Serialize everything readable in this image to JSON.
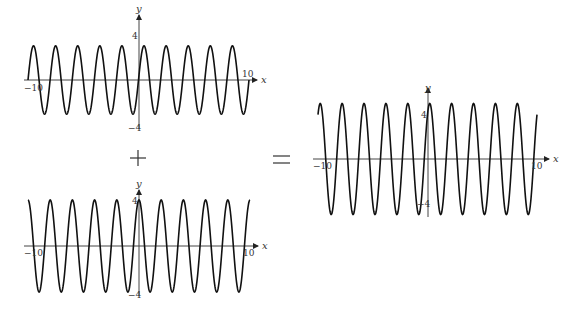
{
  "chart_data": [
    {
      "type": "line",
      "title": "",
      "function": "3 sin(pi x)",
      "amplitude": 3,
      "omega": 3.14159265,
      "phase": 0,
      "form": "sin",
      "xlabel": "x",
      "ylabel": "y",
      "xlim": [
        -10,
        10
      ],
      "ylim": [
        -4,
        4
      ],
      "x_tick_labels": [
        "-10",
        "10"
      ],
      "y_tick_labels": [
        "4",
        "-4"
      ],
      "grid": false,
      "frame": {
        "x0": 28,
        "x1": 249,
        "y0": 80,
        "yscale": 11.4,
        "axis_y_top": 14,
        "axis_y_bottom": 129,
        "axis_x_left": 24,
        "axis_x_right": 258
      }
    },
    {
      "type": "line",
      "title": "",
      "function": "4 cos(pi x)",
      "amplitude": 4,
      "omega": 3.14159265,
      "phase": 1.5707963,
      "form": "sin",
      "xlabel": "x",
      "ylabel": "y",
      "xlim": [
        -10,
        10
      ],
      "ylim": [
        -4,
        4
      ],
      "x_tick_labels": [
        "-10",
        "10"
      ],
      "y_tick_labels": [
        "4",
        "-4"
      ],
      "grid": false,
      "frame": {
        "x0": 28,
        "x1": 250,
        "y0": 246,
        "yscale": 11.5,
        "axis_y_top": 189,
        "axis_y_bottom": 296,
        "axis_x_left": 24,
        "axis_x_right": 259
      }
    },
    {
      "type": "line",
      "title": "",
      "function": "3 sin(pi x) + 4 cos(pi x) = 5 sin(pi x + 0.927)",
      "amplitude": 5,
      "omega": 3.14159265,
      "phase": 0.9273,
      "form": "sin",
      "xlabel": "x",
      "ylabel": "y",
      "xlim": [
        -10,
        10
      ],
      "ylim": [
        -5,
        5
      ],
      "x_tick_labels": [
        "-10",
        "10"
      ],
      "y_tick_labels": [
        "4",
        "-4"
      ],
      "grid": false,
      "frame": {
        "x0": 318,
        "x1": 537,
        "y0": 159,
        "yscale": 11.1,
        "axis_y_top": 87,
        "axis_y_bottom": 217,
        "axis_x_left": 313,
        "axis_x_right": 550
      }
    }
  ],
  "operators": {
    "plus": "+",
    "equals": "="
  },
  "labels": {
    "x": "x",
    "y": "y",
    "neg10": "−10",
    "pos10": "10",
    "four": "4",
    "neg4": "−4"
  }
}
